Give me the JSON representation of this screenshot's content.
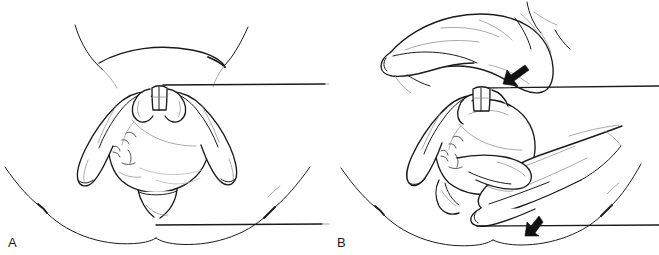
{
  "figure": {
    "kind": "medical-line-illustration",
    "panel_count": 2,
    "background_color": "#ffffff",
    "ink_color": "#1b1b1b",
    "arrow_color": "#111111",
    "width_px": 659,
    "height_px": 255
  },
  "panels": [
    {
      "id": "A",
      "label": "A",
      "label_position": "bottom-left",
      "content_description": "Fetal head at the vaginal outlet, both of the clinician's hands cradling the head from each side with thumbs meeting at the top; maternal thighs and perineum outlined; horizontal reference lines at the level of the head and the perineum.",
      "arrows": []
    },
    {
      "id": "B",
      "label": "B",
      "label_position": "bottom-left",
      "content_description": "Same fetal head with one hand applying suprapubic pressure from above and a second hand applying gentle downward traction on the head; two solid arrows show the directions of applied force.",
      "arrows": [
        {
          "name": "suprapubic-pressure-arrow",
          "direction": "down-left",
          "color": "#111111"
        },
        {
          "name": "downward-traction-arrow",
          "direction": "down",
          "color": "#111111"
        }
      ]
    }
  ],
  "labels": {
    "panel_a": "A",
    "panel_b": "B"
  }
}
